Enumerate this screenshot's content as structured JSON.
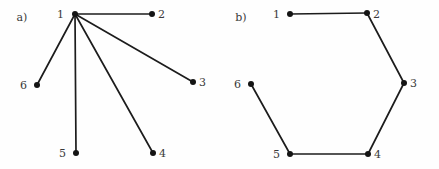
{
  "figure": {
    "background_color": "#fefefe",
    "node_color": "#141414",
    "edge_color": "#1c1c1c",
    "label_color": "#3a3a3a",
    "node_radius": 3,
    "edge_width": 1.7
  },
  "panels": [
    {
      "id": "panel-a",
      "label": "a)",
      "label_x": 22,
      "label_y": 21,
      "graph_type": "star",
      "nodes": [
        {
          "id": "1",
          "label": "1",
          "x": 75,
          "y": 14,
          "label_x": 64,
          "label_y": 18,
          "label_anchor": "end"
        },
        {
          "id": "2",
          "label": "2",
          "x": 152,
          "y": 14,
          "label_x": 158,
          "label_y": 18,
          "label_anchor": "start"
        },
        {
          "id": "3",
          "label": "3",
          "x": 193,
          "y": 82,
          "label_x": 199,
          "label_y": 86,
          "label_anchor": "start"
        },
        {
          "id": "4",
          "label": "4",
          "x": 153,
          "y": 153,
          "label_x": 159,
          "label_y": 157,
          "label_anchor": "start"
        },
        {
          "id": "5",
          "label": "5",
          "x": 76,
          "y": 153,
          "label_x": 66,
          "label_y": 157,
          "label_anchor": "end"
        },
        {
          "id": "6",
          "label": "6",
          "x": 37,
          "y": 85,
          "label_x": 27,
          "label_y": 89,
          "label_anchor": "end"
        }
      ],
      "edges": [
        {
          "from": "1",
          "to": "2"
        },
        {
          "from": "1",
          "to": "3"
        },
        {
          "from": "1",
          "to": "4"
        },
        {
          "from": "1",
          "to": "5"
        },
        {
          "from": "1",
          "to": "6"
        }
      ]
    },
    {
      "id": "panel-b",
      "label": "b)",
      "label_x": 241,
      "label_y": 21,
      "graph_type": "cycle-path",
      "nodes": [
        {
          "id": "1",
          "label": "1",
          "x": 290,
          "y": 14,
          "label_x": 280,
          "label_y": 18,
          "label_anchor": "end"
        },
        {
          "id": "2",
          "label": "2",
          "x": 367,
          "y": 13,
          "label_x": 373,
          "label_y": 18,
          "label_anchor": "start"
        },
        {
          "id": "3",
          "label": "3",
          "x": 404,
          "y": 83,
          "label_x": 410,
          "label_y": 87,
          "label_anchor": "start"
        },
        {
          "id": "4",
          "label": "4",
          "x": 368,
          "y": 154,
          "label_x": 374,
          "label_y": 158,
          "label_anchor": "start"
        },
        {
          "id": "5",
          "label": "5",
          "x": 290,
          "y": 154,
          "label_x": 280,
          "label_y": 158,
          "label_anchor": "end"
        },
        {
          "id": "6",
          "label": "6",
          "x": 251,
          "y": 84,
          "label_x": 241,
          "label_y": 88,
          "label_anchor": "end"
        }
      ],
      "edges": [
        {
          "from": "1",
          "to": "2"
        },
        {
          "from": "2",
          "to": "3"
        },
        {
          "from": "3",
          "to": "4"
        },
        {
          "from": "4",
          "to": "5"
        },
        {
          "from": "5",
          "to": "6"
        }
      ]
    }
  ]
}
